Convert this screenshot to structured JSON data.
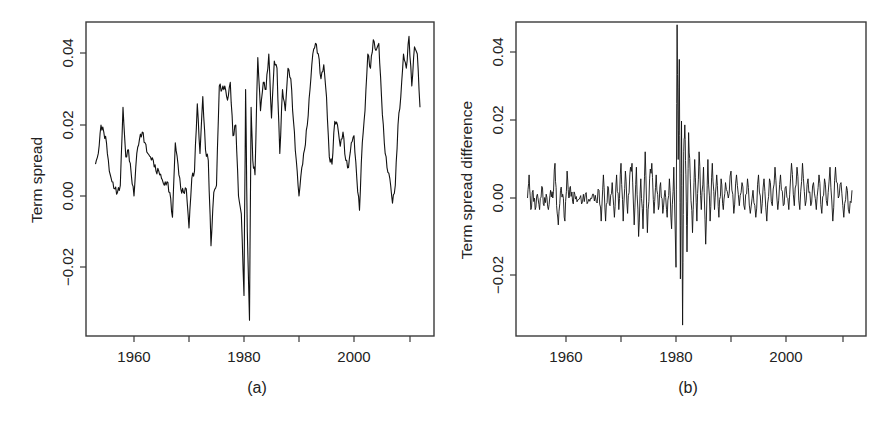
{
  "chart_data": [
    {
      "type": "line",
      "panel": "(a)",
      "title": "",
      "xlabel": "",
      "ylabel": "Term spread",
      "caption": "(a)",
      "xlim": [
        1952.5,
        2013.5
      ],
      "ylim": [
        -0.04,
        0.048
      ],
      "grid": false,
      "legend": null,
      "x_ticks": [
        1960,
        1970,
        1980,
        1990,
        2000,
        2010
      ],
      "x_tick_labels": [
        "1960",
        "",
        "1980",
        "",
        "2000",
        ""
      ],
      "y_ticks": [
        -0.02,
        0.0,
        0.02,
        0.04
      ],
      "y_tick_labels": [
        "-0.02",
        "0.00",
        "0.02",
        "0.04"
      ],
      "series": [
        {
          "name": "Term spread",
          "x": [
            1953.0,
            1953.5,
            1954.0,
            1954.5,
            1955.0,
            1955.5,
            1956.0,
            1956.5,
            1957.0,
            1957.5,
            1958.0,
            1958.5,
            1959.0,
            1959.5,
            1960.0,
            1960.5,
            1961.0,
            1961.5,
            1962.0,
            1962.5,
            1963.0,
            1963.5,
            1964.0,
            1964.5,
            1965.0,
            1965.5,
            1966.0,
            1966.5,
            1967.0,
            1967.5,
            1968.0,
            1968.5,
            1969.0,
            1969.5,
            1970.0,
            1970.5,
            1971.0,
            1971.5,
            1972.0,
            1972.5,
            1973.0,
            1973.5,
            1974.0,
            1974.5,
            1975.0,
            1975.5,
            1976.0,
            1976.5,
            1977.0,
            1977.5,
            1978.0,
            1978.5,
            1979.0,
            1979.5,
            1980.0,
            1980.3,
            1980.6,
            1981.0,
            1981.3,
            1981.6,
            1982.0,
            1982.5,
            1983.0,
            1983.5,
            1984.0,
            1984.5,
            1985.0,
            1985.5,
            1986.0,
            1986.5,
            1987.0,
            1987.5,
            1988.0,
            1988.5,
            1989.0,
            1989.5,
            1990.0,
            1990.5,
            1991.0,
            1991.5,
            1992.0,
            1992.5,
            1993.0,
            1993.5,
            1994.0,
            1994.5,
            1995.0,
            1995.5,
            1996.0,
            1996.5,
            1997.0,
            1997.5,
            1998.0,
            1998.5,
            1999.0,
            1999.5,
            2000.0,
            2000.5,
            2001.0,
            2001.5,
            2002.0,
            2002.5,
            2003.0,
            2003.5,
            2004.0,
            2004.5,
            2005.0,
            2005.5,
            2006.0,
            2006.5,
            2007.0,
            2007.5,
            2008.0,
            2008.5,
            2009.0,
            2009.5,
            2010.0,
            2010.5,
            2011.0,
            2011.5,
            2012.0
          ],
          "values": [
            0.009,
            0.012,
            0.02,
            0.018,
            0.015,
            0.007,
            0.004,
            0.002,
            0.001,
            0.003,
            0.025,
            0.011,
            0.013,
            0.006,
            0.0,
            0.012,
            0.016,
            0.018,
            0.015,
            0.012,
            0.011,
            0.01,
            0.007,
            0.007,
            0.005,
            0.003,
            0.004,
            0.001,
            -0.006,
            0.015,
            0.009,
            0.002,
            0.001,
            0.002,
            -0.009,
            0.005,
            0.007,
            0.026,
            0.012,
            0.028,
            0.013,
            0.01,
            -0.014,
            0.001,
            0.003,
            0.031,
            0.03,
            0.031,
            0.027,
            0.032,
            0.017,
            0.02,
            0.0,
            -0.005,
            -0.028,
            0.03,
            -0.01,
            -0.035,
            0.025,
            0.01,
            0.006,
            0.039,
            0.024,
            0.032,
            0.03,
            0.04,
            0.022,
            0.038,
            0.036,
            0.012,
            0.03,
            0.024,
            0.036,
            0.033,
            0.021,
            0.01,
            0.0,
            0.008,
            0.013,
            0.02,
            0.03,
            0.04,
            0.043,
            0.04,
            0.033,
            0.037,
            0.028,
            0.011,
            0.009,
            0.021,
            0.02,
            0.014,
            0.018,
            0.01,
            0.008,
            0.015,
            0.017,
            0.005,
            -0.004,
            0.015,
            0.024,
            0.04,
            0.036,
            0.044,
            0.041,
            0.043,
            0.028,
            0.015,
            0.008,
            0.005,
            -0.002,
            0.003,
            0.02,
            0.028,
            0.04,
            0.036,
            0.045,
            0.031,
            0.042,
            0.04,
            0.025
          ]
        }
      ]
    },
    {
      "type": "line",
      "panel": "(b)",
      "title": "",
      "xlabel": "",
      "ylabel": "Term spread difference",
      "caption": "(b)",
      "xlim": [
        1951.5,
        2015.0
      ],
      "ylim": [
        -0.037,
        0.048
      ],
      "grid": false,
      "legend": null,
      "x_ticks": [
        1960,
        1970,
        1980,
        1990,
        2000,
        2010
      ],
      "x_tick_labels": [
        "1960",
        "",
        "1980",
        "",
        "2000",
        ""
      ],
      "y_ticks": [
        -0.02,
        0.0,
        0.02,
        0.04
      ],
      "y_tick_labels": [
        "-0.02",
        "0.00",
        "0.02",
        "0.04"
      ],
      "series": [
        {
          "name": "Term spread difference",
          "x": [
            1953.0,
            1953.3,
            1953.6,
            1954.0,
            1954.4,
            1954.8,
            1955.2,
            1955.6,
            1956.0,
            1956.4,
            1956.8,
            1957.2,
            1957.6,
            1958.0,
            1958.3,
            1958.6,
            1959.0,
            1959.4,
            1959.8,
            1960.2,
            1960.5,
            1960.8,
            1961.2,
            1961.6,
            1962.0,
            1962.5,
            1963.0,
            1963.5,
            1964.0,
            1964.5,
            1965.0,
            1965.5,
            1966.0,
            1966.4,
            1966.8,
            1967.2,
            1967.6,
            1968.0,
            1968.4,
            1968.8,
            1969.2,
            1969.6,
            1970.0,
            1970.4,
            1970.8,
            1971.2,
            1971.6,
            1972.0,
            1972.4,
            1972.8,
            1973.2,
            1973.6,
            1974.0,
            1974.4,
            1974.8,
            1975.2,
            1975.6,
            1976.0,
            1976.4,
            1976.8,
            1977.2,
            1977.6,
            1978.0,
            1978.4,
            1978.8,
            1979.2,
            1979.6,
            1980.0,
            1980.2,
            1980.4,
            1980.6,
            1980.8,
            1981.0,
            1981.2,
            1981.4,
            1981.6,
            1981.8,
            1982.0,
            1982.3,
            1982.6,
            1983.0,
            1983.4,
            1983.8,
            1984.2,
            1984.6,
            1985.0,
            1985.4,
            1985.8,
            1986.2,
            1986.6,
            1987.0,
            1987.4,
            1987.8,
            1988.2,
            1988.6,
            1989.0,
            1989.5,
            1990.0,
            1990.5,
            1991.0,
            1991.5,
            1992.0,
            1992.5,
            1993.0,
            1993.5,
            1994.0,
            1994.5,
            1995.0,
            1995.5,
            1996.0,
            1996.5,
            1997.0,
            1997.5,
            1998.0,
            1998.5,
            1999.0,
            1999.5,
            2000.0,
            2000.5,
            2001.0,
            2001.5,
            2002.0,
            2002.5,
            2003.0,
            2003.5,
            2004.0,
            2004.5,
            2005.0,
            2005.5,
            2006.0,
            2006.5,
            2007.0,
            2007.5,
            2008.0,
            2008.5,
            2009.0,
            2009.5,
            2010.0,
            2010.5,
            2011.0,
            2011.5,
            2012.0
          ],
          "values": [
            0.0,
            0.006,
            -0.003,
            0.002,
            -0.003,
            0.001,
            -0.003,
            0.003,
            -0.002,
            0.001,
            -0.003,
            0.002,
            0.0,
            0.009,
            -0.002,
            -0.007,
            0.002,
            0.001,
            -0.006,
            0.007,
            0.0,
            0.003,
            -0.001,
            0.001,
            -0.001,
            0.0,
            -0.001,
            0.001,
            -0.001,
            0.0,
            0.001,
            -0.001,
            0.002,
            -0.006,
            0.006,
            -0.006,
            0.003,
            -0.002,
            0.004,
            -0.005,
            0.006,
            -0.003,
            0.009,
            -0.006,
            0.007,
            -0.004,
            0.006,
            0.009,
            -0.007,
            0.008,
            -0.01,
            0.005,
            -0.008,
            0.012,
            -0.009,
            0.005,
            0.009,
            -0.004,
            0.006,
            -0.003,
            0.004,
            -0.004,
            0.002,
            -0.005,
            0.005,
            -0.008,
            0.008,
            -0.018,
            0.045,
            0.01,
            0.036,
            -0.021,
            0.02,
            -0.033,
            0.012,
            0.019,
            0.006,
            -0.014,
            0.017,
            0.005,
            -0.009,
            0.01,
            -0.006,
            0.012,
            -0.003,
            0.008,
            -0.012,
            0.01,
            -0.006,
            0.009,
            -0.003,
            0.006,
            -0.005,
            0.005,
            -0.003,
            0.004,
            0.0,
            0.007,
            -0.004,
            0.006,
            -0.002,
            0.004,
            -0.003,
            0.005,
            -0.004,
            0.002,
            -0.005,
            0.006,
            -0.004,
            0.005,
            -0.006,
            0.005,
            -0.002,
            0.008,
            -0.003,
            0.006,
            -0.002,
            0.003,
            -0.003,
            0.009,
            -0.002,
            0.008,
            -0.003,
            0.009,
            -0.002,
            0.005,
            -0.002,
            0.004,
            -0.003,
            0.006,
            -0.004,
            0.005,
            -0.002,
            0.008,
            -0.006,
            0.008,
            0.0,
            0.004,
            -0.005,
            0.003,
            -0.004,
            0.002,
            -0.003
          ]
        }
      ]
    }
  ],
  "panels": {
    "a": {
      "ylabel": "Term spread",
      "caption": "(a)",
      "xtick_labels": [
        "1960",
        "1980",
        "2000"
      ],
      "ytick_labels": [
        "-0.02",
        "0.00",
        "0.02",
        "0.04"
      ]
    },
    "b": {
      "ylabel": "Term spread difference",
      "caption": "(b)",
      "xtick_labels": [
        "1960",
        "1980",
        "2000"
      ],
      "ytick_labels": [
        "-0.02",
        "0.00",
        "0.02",
        "0.04"
      ]
    }
  }
}
